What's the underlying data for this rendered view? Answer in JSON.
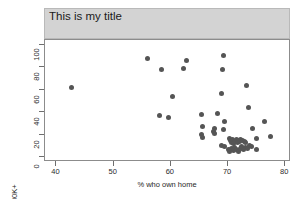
{
  "chart_data": {
    "type": "scatter",
    "title": "This is my\ntitle",
    "xlabel": "% who own home",
    "ylabel": "% homes cost $100K+",
    "xlim": [
      38,
      81
    ],
    "ylim": [
      -4,
      104
    ],
    "xticks": [
      40,
      50,
      60,
      70,
      80
    ],
    "yticks": [
      0,
      20,
      40,
      60,
      80,
      100
    ],
    "grid": false,
    "legend": null,
    "marker": {
      "shape": "circle",
      "color": "#555555",
      "size": 5
    },
    "title_banner_color": "#d3d3d3",
    "points": [
      {
        "x": 42.7,
        "y": 62
      },
      {
        "x": 56.0,
        "y": 88
      },
      {
        "x": 58.3,
        "y": 78
      },
      {
        "x": 62.2,
        "y": 79
      },
      {
        "x": 62.8,
        "y": 86
      },
      {
        "x": 69.2,
        "y": 90
      },
      {
        "x": 69.1,
        "y": 78
      },
      {
        "x": 73.2,
        "y": 64
      },
      {
        "x": 68.8,
        "y": 57
      },
      {
        "x": 60.3,
        "y": 54
      },
      {
        "x": 73.5,
        "y": 44
      },
      {
        "x": 58.1,
        "y": 37
      },
      {
        "x": 59.6,
        "y": 35
      },
      {
        "x": 65.4,
        "y": 38
      },
      {
        "x": 68.1,
        "y": 39
      },
      {
        "x": 69.3,
        "y": 32
      },
      {
        "x": 76.3,
        "y": 32
      },
      {
        "x": 65.5,
        "y": 27
      },
      {
        "x": 67.6,
        "y": 26
      },
      {
        "x": 69.2,
        "y": 25
      },
      {
        "x": 74.2,
        "y": 26
      },
      {
        "x": 65.4,
        "y": 20
      },
      {
        "x": 65.5,
        "y": 18
      },
      {
        "x": 67.5,
        "y": 23
      },
      {
        "x": 67.6,
        "y": 21
      },
      {
        "x": 74.9,
        "y": 17
      },
      {
        "x": 77.5,
        "y": 19
      },
      {
        "x": 68.9,
        "y": 11
      },
      {
        "x": 69.4,
        "y": 10
      },
      {
        "x": 70.2,
        "y": 17
      },
      {
        "x": 70.4,
        "y": 15
      },
      {
        "x": 70.6,
        "y": 13
      },
      {
        "x": 70.8,
        "y": 16
      },
      {
        "x": 71.0,
        "y": 12
      },
      {
        "x": 71.2,
        "y": 14
      },
      {
        "x": 71.4,
        "y": 16
      },
      {
        "x": 71.6,
        "y": 13
      },
      {
        "x": 71.8,
        "y": 15
      },
      {
        "x": 72.0,
        "y": 14
      },
      {
        "x": 72.2,
        "y": 16
      },
      {
        "x": 72.5,
        "y": 15
      },
      {
        "x": 72.8,
        "y": 14
      },
      {
        "x": 73.1,
        "y": 13
      },
      {
        "x": 70.0,
        "y": 7
      },
      {
        "x": 70.3,
        "y": 5
      },
      {
        "x": 70.6,
        "y": 8
      },
      {
        "x": 70.9,
        "y": 6
      },
      {
        "x": 71.2,
        "y": 9
      },
      {
        "x": 71.5,
        "y": 7
      },
      {
        "x": 71.8,
        "y": 5
      },
      {
        "x": 72.1,
        "y": 8
      },
      {
        "x": 72.4,
        "y": 10
      },
      {
        "x": 72.7,
        "y": 7
      },
      {
        "x": 73.0,
        "y": 9
      },
      {
        "x": 73.4,
        "y": 8
      },
      {
        "x": 73.8,
        "y": 11
      },
      {
        "x": 74.1,
        "y": 10
      },
      {
        "x": 75.0,
        "y": 7
      }
    ]
  }
}
